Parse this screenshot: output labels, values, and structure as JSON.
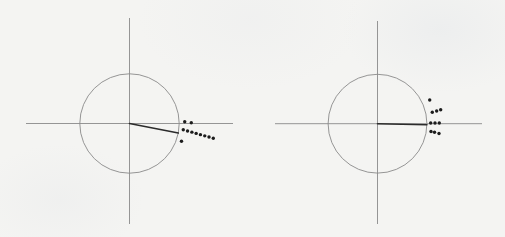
{
  "figure": {
    "background_color": "#f4f4f2",
    "axis_color": "#8a8a8a",
    "circle_color": "#8a8a8a",
    "needle_color": "#2b2b2b",
    "point_color": "#1c1c1c"
  },
  "chart_data": [
    {
      "type": "scatter",
      "title": "",
      "xlabel": "",
      "ylabel": "",
      "grid": false,
      "unit_circle": true,
      "needle": {
        "angle_deg": -11,
        "length": 1.0
      },
      "points": [
        [
          1.111,
          0.036
        ],
        [
          1.243,
          0.016
        ],
        [
          1.082,
          -0.125
        ],
        [
          1.168,
          -0.15
        ],
        [
          1.255,
          -0.174
        ],
        [
          1.341,
          -0.199
        ],
        [
          1.427,
          -0.224
        ],
        [
          1.514,
          -0.248
        ],
        [
          1.6,
          -0.273
        ],
        [
          1.686,
          -0.298
        ],
        [
          1.046,
          -0.358
        ]
      ],
      "xlim": [
        -2.08,
        2.08
      ],
      "ylim": [
        -2.02,
        2.12
      ],
      "layout": {
        "panel_x": 0,
        "panel_w": 252,
        "panel_h": 237,
        "cx_px": 129.5,
        "cy_px": 123.5,
        "r_px": 49.7,
        "h_axis_px": [
          26,
          233
        ],
        "v_axis_px": [
          18,
          224
        ]
      }
    },
    {
      "type": "scatter",
      "title": "",
      "xlabel": "",
      "ylabel": "",
      "grid": false,
      "unit_circle": true,
      "needle": {
        "angle_deg": -1.2,
        "length": 1.0
      },
      "points": [
        [
          1.057,
          0.48
        ],
        [
          1.109,
          0.231
        ],
        [
          1.198,
          0.257
        ],
        [
          1.279,
          0.283
        ],
        [
          1.077,
          0.014
        ],
        [
          1.164,
          0.014
        ],
        [
          1.251,
          0.014
        ],
        [
          1.083,
          -0.158
        ],
        [
          1.154,
          -0.174
        ],
        [
          1.245,
          -0.198
        ]
      ],
      "xlim": [
        -2.12,
        2.12
      ],
      "ylim": [
        -2.02,
        2.08
      ],
      "layout": {
        "panel_x": 252,
        "panel_w": 253,
        "panel_h": 237,
        "cx_px": 125.5,
        "cy_px": 123.7,
        "r_px": 49.4,
        "h_axis_px": [
          23,
          230
        ],
        "v_axis_px": [
          21,
          224
        ]
      }
    }
  ]
}
